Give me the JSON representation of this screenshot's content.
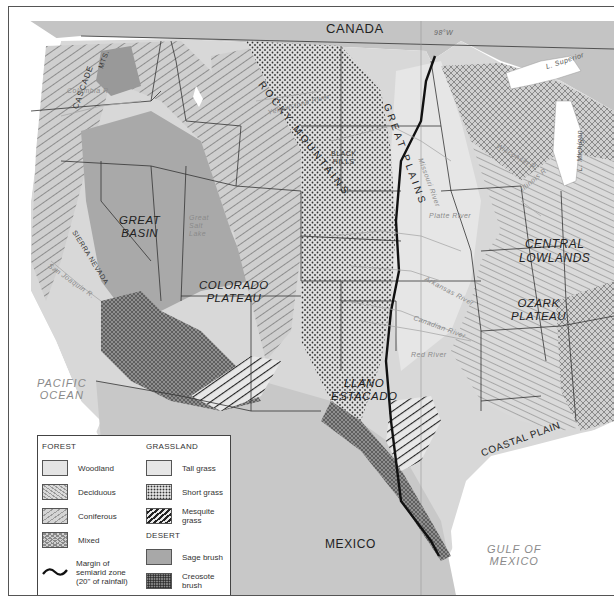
{
  "map": {
    "countries": {
      "canada": "CANADA",
      "mexico": "MEXICO"
    },
    "water_bodies": {
      "pacific": [
        "PACIFIC",
        "OCEAN"
      ],
      "gulf": [
        "GULF OF",
        "MEXICO"
      ],
      "lake_superior": "L. Superior",
      "lake_michigan": "L. Michigan",
      "great_salt_lake": [
        "Great",
        "Salt",
        "Lake"
      ]
    },
    "regions": {
      "great_basin": [
        "GREAT",
        "BASIN"
      ],
      "colorado_plateau": [
        "COLORADO",
        "PLATEAU"
      ],
      "central_lowlands": [
        "CENTRAL",
        "LOWLANDS"
      ],
      "ozark_plateau": [
        "OZARK",
        "PLATEAU"
      ],
      "llano_estacado": [
        "LLANO",
        "ESTACADO"
      ],
      "coastal_plain": "COASTAL PLAIN",
      "black_hills": [
        "BLACK",
        "HILLS"
      ]
    },
    "mountains": {
      "rocky": "ROCKY MOUNTAINS",
      "great_plains": "GREAT PLAINS",
      "cascade": "CASCADE",
      "cascade_mts": "MTS.",
      "sierra_nevada": "SIERRA NEVADA"
    },
    "rivers": {
      "columbia": "Columbia R.",
      "san_joaquin": "San Joaquin R.",
      "platte": "Platte River",
      "arkansas": "Arkansas River",
      "canadian": "Canadian River",
      "red": "Red River",
      "missouri": "Missouri River",
      "illinois": "Illinois R.",
      "wisconsin": "Wisconsin R.",
      "yellowstone": "Yellowstone River"
    },
    "meridian": "98°W"
  },
  "legend": {
    "forest": {
      "heading": "FOREST",
      "items": [
        {
          "label": "Woodland",
          "pattern": "woodland"
        },
        {
          "label": "Deciduous",
          "pattern": "deciduous"
        },
        {
          "label": "Coniferous",
          "pattern": "coniferous"
        },
        {
          "label": "Mixed",
          "pattern": "mixed"
        }
      ],
      "margin_label": [
        "Margin of",
        "semiarid zone",
        "(20\" of rainfall)"
      ]
    },
    "grassland": {
      "heading": "GRASSLAND",
      "items": [
        {
          "label": "Tall grass",
          "pattern": "tallgrass"
        },
        {
          "label": "Short grass",
          "pattern": "shortgrass"
        },
        {
          "label": "Mesquite grass",
          "pattern": "mesquite"
        }
      ]
    },
    "desert": {
      "heading": "DESERT",
      "items": [
        {
          "label": "Sage brush",
          "pattern": "sagebrush"
        },
        {
          "label": "Creosote brush",
          "pattern": "creosote"
        }
      ]
    }
  },
  "colors": {
    "land": "#dcdcdc",
    "tallgrass": "#e6e6e6",
    "sagebrush": "#a8a8a8",
    "water": "#ffffff",
    "border": "#333333",
    "ink": "#222222"
  }
}
